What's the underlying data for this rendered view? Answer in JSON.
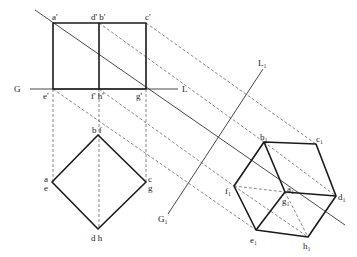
{
  "diagram": {
    "type": "orthographic-to-auxiliary-projection",
    "front_view": {
      "labels": {
        "a_prime": "a'",
        "db_prime": "d' b'",
        "c_prime": "c'",
        "e_prime": "e'",
        "fh_prime": "f' h'",
        "g_prime": "g'"
      },
      "points": {
        "a_prime": [
          53,
          23
        ],
        "db_prime": [
          99,
          23
        ],
        "c_prime": [
          146,
          23
        ],
        "e_prime": [
          53,
          89
        ],
        "fh_prime": [
          99,
          89
        ],
        "g_prime": [
          146,
          89
        ]
      }
    },
    "ground_line": {
      "left_label": "G",
      "right_label": "L",
      "y": 89,
      "x_start": 30,
      "x_end": 178
    },
    "top_view": {
      "labels": {
        "bf": "b f",
        "ae_a": "a",
        "ae_e": "e",
        "cg_c": "c",
        "cg_g": "g",
        "dh": "d h"
      },
      "points": {
        "bf": [
          98,
          135
        ],
        "ae": [
          52,
          182
        ],
        "cg": [
          146,
          182
        ],
        "dh": [
          98,
          229
        ]
      }
    },
    "auxiliary_ground_line": {
      "start_label": "G₁",
      "end_label": "L₁",
      "start": [
        168,
        214
      ],
      "end": [
        263,
        69
      ]
    },
    "auxiliary_view": {
      "labels": {
        "b1": "b₁",
        "c1": "c₁",
        "d1": "d₁",
        "h1": "h₁",
        "e1": "e₁",
        "f1": "f₁",
        "a1": "a₁",
        "g1": "g₁"
      },
      "points": {
        "b1": [
          264,
          142
        ],
        "c1": [
          316,
          144
        ],
        "d1": [
          336,
          196
        ],
        "h1": [
          308,
          237
        ],
        "e1": [
          256,
          230
        ],
        "f1": [
          234,
          186
        ],
        "a1g1": [
          285,
          192
        ]
      }
    },
    "main_diagonal": {
      "start": [
        35,
        10
      ],
      "end": [
        345,
        225
      ]
    }
  }
}
